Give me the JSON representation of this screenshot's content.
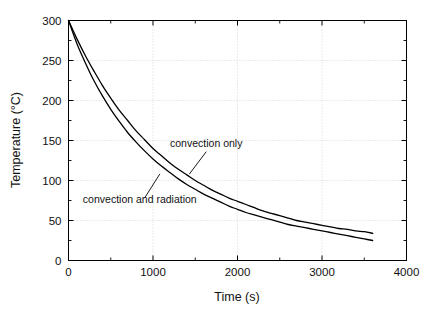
{
  "chart_data": {
    "type": "line",
    "title": "",
    "xlabel": "Time (s)",
    "ylabel": "Temperature (°C)",
    "xlim": [
      0,
      4000
    ],
    "ylim": [
      0,
      300
    ],
    "xticks": [
      0,
      1000,
      2000,
      3000,
      4000
    ],
    "xtick_labels": [
      "0",
      "1000",
      "2000",
      "3000",
      "4000"
    ],
    "yticks": [
      0,
      50,
      100,
      150,
      200,
      250,
      300
    ],
    "ytick_labels": [
      "0",
      "50",
      "100",
      "150",
      "200",
      "250",
      "300"
    ],
    "x_minor_tick_interval": 500,
    "y_minor_tick_interval": 25,
    "grid": true,
    "grid_style": "dotted",
    "grid_color": "#cccccc",
    "legend": "none",
    "annotations": [
      {
        "text": "convection only",
        "text_x": 1630,
        "text_y": 142,
        "leader_from_x": 1630,
        "leader_from_y": 136,
        "leader_to_x": 1430,
        "leader_to_y": 108
      },
      {
        "text": "convection and radiation",
        "text_x": 170,
        "text_y": 72,
        "leader_from_x": 900,
        "leader_from_y": 78,
        "leader_to_x": 1080,
        "leader_to_y": 108
      }
    ],
    "series": [
      {
        "name": "convection only",
        "color": "#000000",
        "line_width": 1.3,
        "x": [
          0,
          100,
          200,
          300,
          400,
          500,
          600,
          700,
          800,
          900,
          1000,
          1100,
          1200,
          1300,
          1400,
          1500,
          1600,
          1700,
          1800,
          1900,
          2000,
          2100,
          2200,
          2300,
          2400,
          2500,
          2600,
          2700,
          2800,
          2900,
          3000,
          3100,
          3200,
          3300,
          3400,
          3500,
          3600
        ],
        "y": [
          300,
          277,
          256,
          237,
          219,
          203,
          188,
          175,
          162,
          151,
          140,
          131,
          122,
          114,
          107,
          100,
          94,
          88,
          83,
          78,
          74,
          70,
          66,
          62,
          59,
          56,
          53,
          50,
          48,
          46,
          44,
          42,
          40,
          39,
          37,
          36,
          34
        ]
      },
      {
        "name": "convection and radiation",
        "color": "#000000",
        "line_width": 1.3,
        "x": [
          0,
          100,
          200,
          300,
          400,
          500,
          600,
          700,
          800,
          900,
          1000,
          1100,
          1200,
          1300,
          1400,
          1500,
          1600,
          1700,
          1800,
          1900,
          2000,
          2100,
          2200,
          2300,
          2400,
          2500,
          2600,
          2700,
          2800,
          2900,
          3000,
          3100,
          3200,
          3300,
          3400,
          3500,
          3600
        ],
        "y": [
          300,
          271,
          247,
          225,
          206,
          189,
          174,
          160,
          148,
          137,
          127,
          118,
          110,
          102,
          95,
          89,
          83,
          78,
          73,
          68,
          64,
          60,
          57,
          54,
          51,
          48,
          45,
          43,
          41,
          39,
          37,
          35,
          33,
          31,
          29,
          27,
          25
        ]
      }
    ]
  }
}
